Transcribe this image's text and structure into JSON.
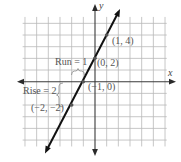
{
  "diagram": {
    "type": "coordinate-plane-linear-graph",
    "axes": {
      "x_label": "x",
      "y_label": "y"
    },
    "grid": {
      "x_range": [
        -6,
        6
      ],
      "y_range": [
        -5,
        5
      ],
      "step": 1
    },
    "line": {
      "equation": "y = 2x + 2",
      "slope": 2,
      "y_intercept": 2
    },
    "points": [
      {
        "label": "(1, 4)",
        "x": 1,
        "y": 4
      },
      {
        "label": "(0, 2)",
        "x": 0,
        "y": 2
      },
      {
        "label": "(−1, 0)",
        "x": -1,
        "y": 0
      },
      {
        "label": "(−2, −2)",
        "x": -2,
        "y": -2
      }
    ],
    "annotations": {
      "run": "Run = 1",
      "rise": "Rise = 2"
    },
    "colors": {
      "grid": "#b9b9b9",
      "axis": "#3a3a3a",
      "line": "#111111",
      "label": "#555555"
    }
  }
}
